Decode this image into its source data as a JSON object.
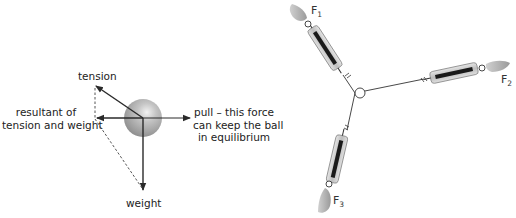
{
  "left_diagram": {
    "labels": {
      "tension": "tension",
      "resultant_line1": "resultant of",
      "resultant_line2": "tension and weight",
      "pull_line1": "pull – this force",
      "pull_line2": "can keep the ball",
      "pull_line3": "in equilibrium",
      "weight": "weight"
    },
    "colors": {
      "ball": "#a8a8a8",
      "arrow": "#2a2a2a",
      "dashed": "#555555"
    }
  },
  "right_diagram": {
    "forces": [
      {
        "name": "F",
        "sub": "1"
      },
      {
        "name": "F",
        "sub": "2"
      },
      {
        "name": "F",
        "sub": "3"
      }
    ]
  }
}
